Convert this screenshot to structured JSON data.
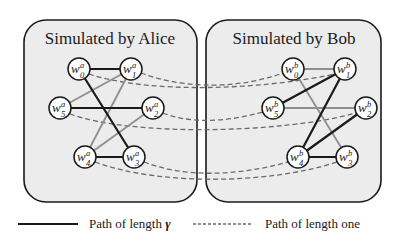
{
  "panels": {
    "alice": {
      "title": "Simulated by Alice",
      "party": "a"
    },
    "bob": {
      "title": "Simulated by Bob",
      "party": "b"
    }
  },
  "nodes": {
    "alice": [
      {
        "id": "w0a",
        "base": "w",
        "index": "0",
        "sup": "a",
        "x": 79,
        "y": 69
      },
      {
        "id": "w1a",
        "base": "w",
        "index": "1",
        "sup": "a",
        "x": 131,
        "y": 69
      },
      {
        "id": "w5a",
        "base": "w",
        "index": "5",
        "sup": "a",
        "x": 60,
        "y": 108
      },
      {
        "id": "w2a",
        "base": "w",
        "index": "2",
        "sup": "a",
        "x": 153,
        "y": 108
      },
      {
        "id": "w4a",
        "base": "w",
        "index": "4",
        "sup": "a",
        "x": 85,
        "y": 157
      },
      {
        "id": "w3a",
        "base": "w",
        "index": "3",
        "sup": "a",
        "x": 134,
        "y": 157
      }
    ],
    "bob": [
      {
        "id": "w0b",
        "base": "w",
        "index": "0",
        "sup": "b",
        "x": 293,
        "y": 69
      },
      {
        "id": "w1b",
        "base": "w",
        "index": "1",
        "sup": "b",
        "x": 345,
        "y": 69
      },
      {
        "id": "w5b",
        "base": "w",
        "index": "5",
        "sup": "b",
        "x": 273,
        "y": 108
      },
      {
        "id": "w2b",
        "base": "w",
        "index": "2",
        "sup": "b",
        "x": 366,
        "y": 108
      },
      {
        "id": "w4b",
        "base": "w",
        "index": "4",
        "sup": "b",
        "x": 298,
        "y": 157
      },
      {
        "id": "w3b",
        "base": "w",
        "index": "3",
        "sup": "b",
        "x": 347,
        "y": 157
      }
    ]
  },
  "edges": {
    "alice": [
      {
        "from": "w0a",
        "to": "w1a",
        "style": "black"
      },
      {
        "from": "w5a",
        "to": "w2a",
        "style": "black"
      },
      {
        "from": "w0a",
        "to": "w3a",
        "style": "black"
      },
      {
        "from": "w4a",
        "to": "w3a",
        "style": "black"
      },
      {
        "from": "w5a",
        "to": "w1a",
        "style": "gray"
      },
      {
        "from": "w4a",
        "to": "w1a",
        "style": "gray"
      },
      {
        "from": "w4a",
        "to": "w2a",
        "style": "gray"
      }
    ],
    "bob": [
      {
        "from": "w0b",
        "to": "w1b",
        "style": "gray"
      },
      {
        "from": "w5b",
        "to": "w2b",
        "style": "gray"
      },
      {
        "from": "w0b",
        "to": "w3b",
        "style": "gray"
      },
      {
        "from": "w5b",
        "to": "w1b",
        "style": "black"
      },
      {
        "from": "w4b",
        "to": "w1b",
        "style": "black"
      },
      {
        "from": "w4b",
        "to": "w2b",
        "style": "black"
      },
      {
        "from": "w4b",
        "to": "w3b",
        "style": "black"
      }
    ],
    "cross": [
      {
        "from": "w1a",
        "to": "w0b",
        "style": "dashed"
      },
      {
        "from": "w0a",
        "to": "w1b",
        "style": "dashed"
      },
      {
        "from": "w2a",
        "to": "w5b",
        "style": "dashed"
      },
      {
        "from": "w5a",
        "to": "w2b",
        "style": "dashed"
      },
      {
        "from": "w3a",
        "to": "w4b",
        "style": "dashed"
      },
      {
        "from": "w4a",
        "to": "w3b",
        "style": "dashed"
      }
    ]
  },
  "legend": {
    "solid": {
      "label": "Path of length ",
      "symbol": "γ"
    },
    "dashed": {
      "label": "Path of length one"
    }
  },
  "colors": {
    "panel_fill": "#ececec",
    "stroke": "#1a1a1a",
    "gray_edge": "#8e8e8e",
    "dashed_edge": "#6a6a6a"
  }
}
